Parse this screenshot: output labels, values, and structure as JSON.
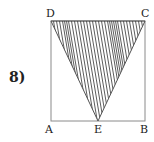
{
  "problem": {
    "number_label": "8)"
  },
  "figure": {
    "type": "square-with-shaded-triangle",
    "square_vertices": [
      "A",
      "B",
      "C",
      "D"
    ],
    "triangle_vertices": [
      "D",
      "C",
      "E"
    ],
    "shaded_region": "triangle DCE",
    "labels": {
      "A": "A",
      "B": "B",
      "C": "C",
      "D": "D",
      "E": "E"
    },
    "colors": {
      "stroke": "#8a8a8a",
      "hatch": "#333333",
      "label": "#222222"
    }
  }
}
